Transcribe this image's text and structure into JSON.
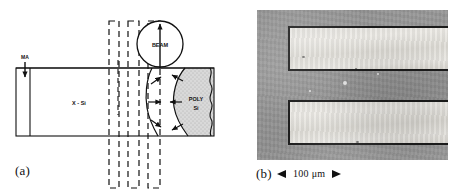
{
  "figure": {
    "panels": [
      {
        "id": "a",
        "caption": "(a)",
        "type": "schematic-diagram",
        "description": "Cross-sectional schematic of zone-melting recrystallization of polysilicon on single-crystal silicon",
        "labels": {
          "beam": "BEAM",
          "substrate": "X - Si",
          "film": "POLY Si",
          "incoming": "MA"
        }
      },
      {
        "id": "b",
        "caption": "(b)",
        "type": "micrograph",
        "scalebar": {
          "label": "100 μm",
          "left_arrow": "arrow-left-icon",
          "right_arrow": "arrow-right-icon"
        }
      }
    ]
  },
  "colors": {
    "ink": "#111111",
    "paper": "#ffffff",
    "poly_fill": "#d8d8d8",
    "micrograph_background": "#949494",
    "stripe_fill": "#e6e4df",
    "stripe_outline": "#1b1b1b"
  }
}
